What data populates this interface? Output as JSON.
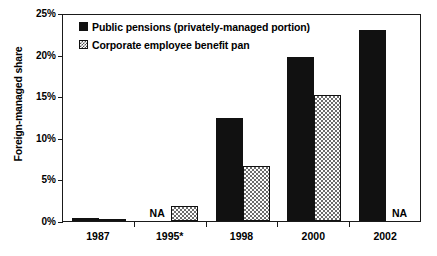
{
  "chart_data": {
    "type": "bar",
    "title": "",
    "xlabel": "",
    "ylabel": "Foreign-managed share",
    "ylim": [
      0,
      25
    ],
    "ytick_labels": [
      "0%",
      "5%",
      "10%",
      "15%",
      "20%",
      "25%"
    ],
    "ytick_values": [
      0,
      5,
      10,
      15,
      20,
      25
    ],
    "grid": false,
    "legend_position": "top-left-inside",
    "categories": [
      "1987",
      "1995*",
      "1998",
      "2000",
      "2002"
    ],
    "series": [
      {
        "name": "Public pensions (privately-managed portion)",
        "fill": "solid-black",
        "color": "#111111",
        "values": [
          0.35,
          null,
          12.4,
          19.7,
          22.9
        ],
        "labels": [
          "",
          "NA",
          "",
          "",
          ""
        ]
      },
      {
        "name": "Corporate employee benefit pan",
        "fill": "checkered-gray",
        "color": "#6e6e6e",
        "values": [
          0.3,
          1.8,
          6.6,
          15.2,
          null
        ],
        "labels": [
          "",
          "",
          "",
          "",
          "NA"
        ]
      }
    ],
    "annotations": [
      {
        "category": "1995*",
        "series": "Public pensions (privately-managed portion)",
        "text": "NA"
      },
      {
        "category": "2002",
        "series": "Corporate employee benefit pan",
        "text": "NA"
      }
    ]
  },
  "legend": {
    "items": [
      {
        "label": "Public pensions (privately-managed portion)",
        "swatch": "solid-swatch"
      },
      {
        "label": "Corporate employee benefit pan",
        "swatch": "hatched-swatch"
      }
    ]
  },
  "colors": {
    "axis": "#1a1a1a",
    "series_solid": "#111111",
    "series_hatch": "#6e6e6e",
    "background": "#ffffff"
  }
}
